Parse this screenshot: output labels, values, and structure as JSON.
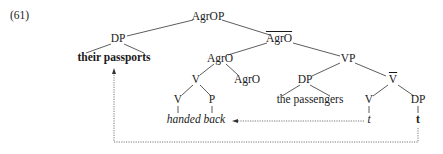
{
  "example_number": "(61)",
  "tree": {
    "root": "AgrOP",
    "spec_dp": "DP",
    "spec_dp_leaf": "their passports",
    "agro_bar": "AgrO",
    "agro_head": "AgrO",
    "v_complex": "V",
    "v_head": "V",
    "p_head": "P",
    "agro_inner": "AgrO",
    "verb_leaf": "handed back",
    "vp": "VP",
    "dp_passengers": "DP",
    "dp_passengers_leaf": "the passengers",
    "v_bar": "V",
    "v_trace_node": "V",
    "v_trace": "t",
    "dp_obj": "DP",
    "dp_trace": "t"
  }
}
